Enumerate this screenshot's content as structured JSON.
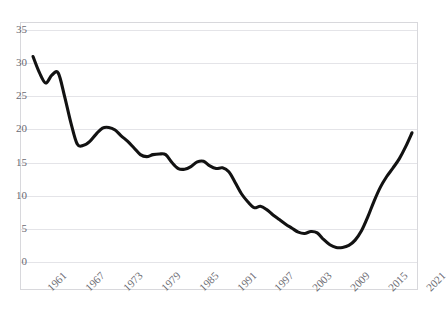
{
  "chart_data": {
    "type": "line",
    "title": "",
    "xlabel": "",
    "ylabel": "",
    "xlim": [
      1961,
      2021
    ],
    "ylim": [
      0,
      35
    ],
    "grid": true,
    "legend": false,
    "line_color": "#121212",
    "grid_color": "#e4e4e8",
    "axis_label_color": "#6a6a72",
    "y_ticks": [
      "0",
      "5",
      "10",
      "15",
      "20",
      "25",
      "30",
      "35"
    ],
    "y_tick_values": [
      0,
      5,
      10,
      15,
      20,
      25,
      30,
      35
    ],
    "x_ticks": [
      "1961",
      "1967",
      "1973",
      "1979",
      "1985",
      "1991",
      "1997",
      "2003",
      "2009",
      "2015",
      "2021"
    ],
    "x_tick_values": [
      1961,
      1967,
      1973,
      1979,
      1985,
      1991,
      1997,
      2003,
      2009,
      2015,
      2021
    ],
    "x": [
      1961,
      1962,
      1963,
      1964,
      1965,
      1966,
      1967,
      1968,
      1969,
      1970,
      1971,
      1972,
      1973,
      1974,
      1975,
      1976,
      1977,
      1978,
      1979,
      1980,
      1981,
      1982,
      1983,
      1984,
      1985,
      1986,
      1987,
      1988,
      1989,
      1990,
      1991,
      1992,
      1993,
      1994,
      1995,
      1996,
      1997,
      1998,
      1999,
      2000,
      2001,
      2002,
      2003,
      2004,
      2005,
      2006,
      2007,
      2008,
      2009,
      2010,
      2011,
      2012,
      2013,
      2014,
      2015,
      2016,
      2017,
      2018,
      2019,
      2020,
      2021
    ],
    "values": [
      31.0,
      28.6,
      27.0,
      28.2,
      28.5,
      25.0,
      21.0,
      17.8,
      17.6,
      18.2,
      19.3,
      20.2,
      20.3,
      19.9,
      19.0,
      18.2,
      17.2,
      16.2,
      15.9,
      16.2,
      16.3,
      16.2,
      15.0,
      14.1,
      14.0,
      14.4,
      15.1,
      15.2,
      14.5,
      14.1,
      14.2,
      13.6,
      12.0,
      10.3,
      9.1,
      8.2,
      8.4,
      7.9,
      7.1,
      6.4,
      5.7,
      5.1,
      4.5,
      4.3,
      4.6,
      4.4,
      3.4,
      2.6,
      2.2,
      2.2,
      2.5,
      3.3,
      4.7,
      6.8,
      9.2,
      11.3,
      12.9,
      14.2,
      15.6,
      17.4,
      19.5
    ],
    "series": [
      {
        "name": "series-1",
        "values": [
          31.0,
          28.6,
          27.0,
          28.2,
          28.5,
          25.0,
          21.0,
          17.8,
          17.6,
          18.2,
          19.3,
          20.2,
          20.3,
          19.9,
          19.0,
          18.2,
          17.2,
          16.2,
          15.9,
          16.2,
          16.3,
          16.2,
          15.0,
          14.1,
          14.0,
          14.4,
          15.1,
          15.2,
          14.5,
          14.1,
          14.2,
          13.6,
          12.0,
          10.3,
          9.1,
          8.2,
          8.4,
          7.9,
          7.1,
          6.4,
          5.7,
          5.1,
          4.5,
          4.3,
          4.6,
          4.4,
          3.4,
          2.6,
          2.2,
          2.2,
          2.5,
          3.3,
          4.7,
          6.8,
          9.2,
          11.3,
          12.9,
          14.2,
          15.6,
          17.4,
          19.5
        ]
      }
    ]
  }
}
